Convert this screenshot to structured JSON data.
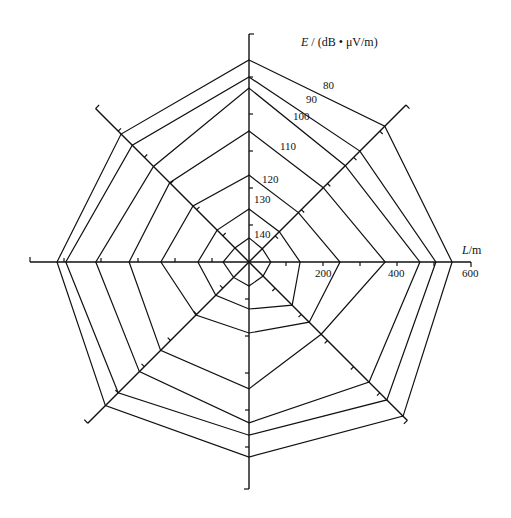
{
  "chart_data": {
    "type": "radar",
    "title": "",
    "value_label": "E / (dB • μV/m)",
    "radial_axis_label": "L/m",
    "radial_ticks": [
      200,
      400,
      600
    ],
    "radial_range": [
      0,
      600
    ],
    "directions": [
      "N",
      "NE",
      "E",
      "SE",
      "S",
      "SW",
      "W",
      "NW"
    ],
    "contour_levels": [
      80,
      90,
      100,
      110,
      120,
      130,
      140
    ],
    "series": [
      {
        "name": "140",
        "values_m": [
          65,
          51,
          59,
          54,
          65,
          59,
          70,
          54
        ]
      },
      {
        "name": "130",
        "values_m": [
          143,
          116,
          138,
          165,
          127,
          127,
          138,
          122
        ]
      },
      {
        "name": "120",
        "values_m": [
          235,
          189,
          246,
          230,
          192,
          203,
          238,
          214
        ]
      },
      {
        "name": "110",
        "values_m": [
          354,
          284,
          368,
          276,
          343,
          338,
          324,
          303
        ]
      },
      {
        "name": "100",
        "values_m": [
          470,
          368,
          462,
          459,
          435,
          419,
          414,
          365
        ]
      },
      {
        "name": "90",
        "values_m": [
          500,
          424,
          505,
          527,
          468,
          500,
          495,
          446
        ]
      },
      {
        "name": "80",
        "values_m": [
          546,
          519,
          549,
          589,
          527,
          549,
          519,
          489
        ]
      }
    ],
    "grid": false,
    "legend": "inline labels along N-NE edge"
  },
  "labels": {
    "e_unit": "(dB • μV/m)",
    "e_symbol": "E",
    "l_symbol": "L",
    "l_unit": "/m",
    "tick_200": "200",
    "tick_400": "400",
    "tick_600": "600",
    "level_80": "80",
    "level_90": "90",
    "level_100": "100",
    "level_110": "110",
    "level_120": "120",
    "level_130": "130",
    "level_140": "140"
  }
}
